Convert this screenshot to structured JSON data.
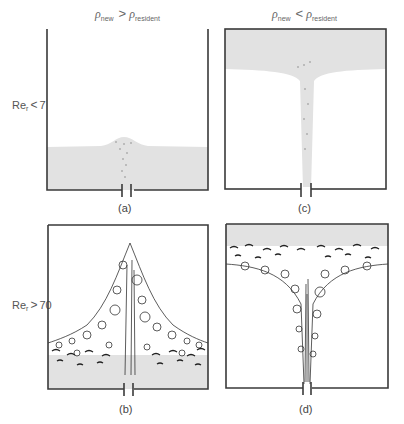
{
  "columns": [
    {
      "symbol": "ρ",
      "left_sub": "new",
      "operator": ">",
      "right_sub": "resident"
    },
    {
      "symbol": "ρ",
      "left_sub": "new",
      "operator": "<",
      "right_sub": "resident"
    }
  ],
  "rows": [
    {
      "label": "Re",
      "sub": "r",
      "operator": "<",
      "value": "7"
    },
    {
      "label": "Re",
      "sub": "r",
      "operator": ">",
      "value": "70"
    }
  ],
  "panels": [
    {
      "id": "a",
      "caption": "(a)",
      "description": "Dense fluid pool at bottom with small laminar bump over nozzle"
    },
    {
      "id": "b",
      "caption": "(b)",
      "description": "Turbulent plume mixing upward from dense bottom layer"
    },
    {
      "id": "c",
      "caption": "(c)",
      "description": "Light fluid layer at top fed by narrow laminar jet"
    },
    {
      "id": "d",
      "caption": "(d)",
      "description": "Turbulent jet rising into light top layer with mixing band"
    }
  ],
  "colors": {
    "fluid": "#e2e2e2",
    "border": "#3a3a3a",
    "eddy": "#333333"
  }
}
